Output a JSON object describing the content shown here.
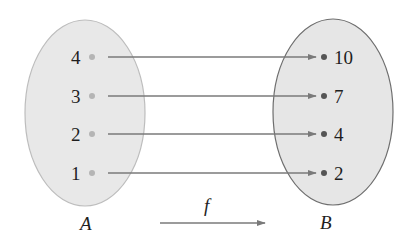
{
  "diagram": {
    "type": "function-mapping",
    "function_label": "f",
    "domain_set": {
      "label": "A",
      "elements": [
        "4",
        "3",
        "2",
        "1"
      ]
    },
    "codomain_set": {
      "label": "B",
      "elements": [
        "10",
        "7",
        "4",
        "2"
      ]
    },
    "mappings": [
      {
        "from": "4",
        "to": "10"
      },
      {
        "from": "3",
        "to": "7"
      },
      {
        "from": "2",
        "to": "4"
      },
      {
        "from": "1",
        "to": "2"
      }
    ],
    "colors": {
      "ellipse_fill": "#e8e8e8",
      "ellipse_stroke_a": "#bdbdbd",
      "ellipse_stroke_b": "#6e6e6e",
      "arrow": "#7a7a7a",
      "dot_a": "#b5b5b5",
      "dot_b": "#555555",
      "text": "#1e1e1e"
    }
  }
}
